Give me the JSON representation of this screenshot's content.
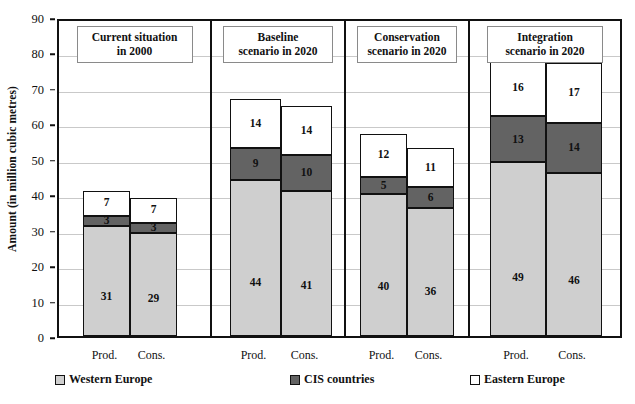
{
  "chart_data": {
    "type": "bar",
    "subtype": "stacked-bar-grouped-panels",
    "title": "",
    "xlabel": "",
    "ylabel": "Amount (in million cubic metres)",
    "ylim": [
      0,
      90
    ],
    "ytick_step": 10,
    "yticks": [
      "0",
      "10",
      "20",
      "30",
      "40",
      "50",
      "60",
      "70",
      "80",
      "90"
    ],
    "grid": true,
    "legend_position": "bottom",
    "series": [
      {
        "name": "Western Europe",
        "color": "#cfcfcf"
      },
      {
        "name": "CIS countries",
        "color": "#636363"
      },
      {
        "name": "Eastern Europe",
        "color": "#ffffff"
      }
    ],
    "panels": [
      {
        "title_line1": "Current  situation",
        "title_line2": "in 2000",
        "bars": [
          {
            "category": "Prod.",
            "values": {
              "Western Europe": 31,
              "CIS countries": 3,
              "Eastern Europe": 7
            },
            "total": 41
          },
          {
            "category": "Cons.",
            "values": {
              "Western Europe": 29,
              "CIS countries": 3,
              "Eastern Europe": 7
            },
            "total": 39
          }
        ]
      },
      {
        "title_line1": "Baseline",
        "title_line2": "scenario in 2020",
        "bars": [
          {
            "category": "Prod.",
            "values": {
              "Western Europe": 44,
              "CIS countries": 9,
              "Eastern Europe": 14
            },
            "total": 67
          },
          {
            "category": "Cons.",
            "values": {
              "Western Europe": 41,
              "CIS countries": 10,
              "Eastern Europe": 14
            },
            "total": 65
          }
        ]
      },
      {
        "title_line1": "Conservation",
        "title_line2": "scenario in 2020",
        "bars": [
          {
            "category": "Prod.",
            "values": {
              "Western Europe": 40,
              "CIS countries": 5,
              "Eastern Europe": 12
            },
            "total": 57
          },
          {
            "category": "Cons.",
            "values": {
              "Western Europe": 36,
              "CIS countries": 6,
              "Eastern Europe": 11
            },
            "total": 53
          }
        ]
      },
      {
        "title_line1": "Integration",
        "title_line2": "scenario in 2020",
        "bars": [
          {
            "category": "Prod.",
            "values": {
              "Western Europe": 49,
              "CIS countries": 13,
              "Eastern Europe": 16
            },
            "total": 78
          },
          {
            "category": "Cons.",
            "values": {
              "Western Europe": 46,
              "CIS countries": 14,
              "Eastern Europe": 17
            },
            "total": 77
          }
        ]
      }
    ]
  },
  "axis": {
    "y_title": "Amount (in million cubic metres)"
  },
  "legend": {
    "items": [
      {
        "label": "Western Europe",
        "swatch": "we"
      },
      {
        "label": "CIS countries",
        "swatch": "cis"
      },
      {
        "label": "Eastern Europe",
        "swatch": "ee"
      }
    ]
  }
}
